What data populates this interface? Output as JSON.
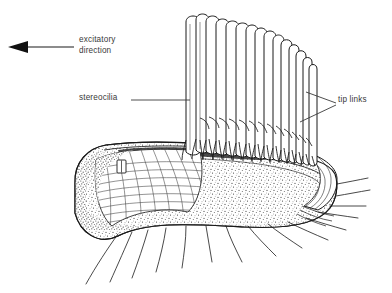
{
  "figure": {
    "background_color": "#ffffff",
    "ink_color": "#1a1a1a",
    "text_color": "#3a3a3a",
    "stipple_color": "#555555"
  },
  "annotations": {
    "excitatory": {
      "text": "excitatory\ndirection",
      "line1": "excitatory",
      "line2": "direction",
      "arrow_direction": "left"
    },
    "stereocilia": {
      "text": "stereocilia",
      "leader": "horizontal-line-right"
    },
    "tip_links": {
      "text": "tip links",
      "leader": "two-lines-left"
    }
  },
  "structure": {
    "stereocilia_count": 15,
    "tip_link_rows": 2,
    "nerve_fiber_count": 9,
    "cuticular_plate": "cross-hatched",
    "basal_body": "rectangle"
  }
}
